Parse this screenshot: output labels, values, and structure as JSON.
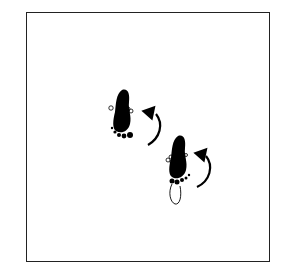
{
  "diagram": {
    "type": "dance-step-footprint-diagram",
    "frame": {
      "border_color": "#222222",
      "background": "#ffffff"
    },
    "elements": [
      {
        "kind": "footprint",
        "side": "right",
        "style": "solid-black",
        "heel": "solid",
        "toes": "solid-dots-at-heel-end",
        "rotation_hint": "pivot"
      },
      {
        "kind": "rotation-arrow",
        "direction": "counterclockwise",
        "near": "footprint-1"
      },
      {
        "kind": "footprint",
        "side": "left",
        "style": "solid-black-ball-outline-heel",
        "heel": "outline",
        "toes": "outline-circles-and-solid-dots",
        "rotation_hint": "pivot"
      },
      {
        "kind": "rotation-arrow",
        "direction": "counterclockwise",
        "near": "footprint-2"
      }
    ],
    "colors": {
      "ink": "#000000",
      "paper": "#ffffff"
    }
  }
}
